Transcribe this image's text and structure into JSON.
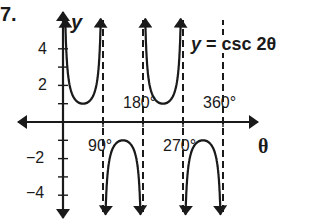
{
  "problem_number": "7.",
  "chart_data": {
    "type": "line",
    "title": "y = csc 2θ",
    "function": "csc(2*theta)",
    "xlabel": "θ",
    "ylabel": "y",
    "x_unit": "degrees",
    "xlim": [
      -60,
      420
    ],
    "ylim": [
      -5.5,
      5.5
    ],
    "x_tick_labels": [
      "90°",
      "180°",
      "270°",
      "360°"
    ],
    "x_ticks": [
      90,
      180,
      270,
      360
    ],
    "y_tick_labels": [
      "4",
      "2",
      "−2",
      "−4"
    ],
    "y_ticks": [
      -4,
      -3,
      -2,
      -1,
      1,
      2,
      3,
      4
    ],
    "labeled_y_ticks": [
      4,
      2,
      -2,
      -4
    ],
    "asymptotes": [
      0,
      90,
      180,
      270,
      360
    ],
    "branches": [
      {
        "from": 0,
        "to": 90,
        "direction": "up",
        "extremum": {
          "x": 45,
          "y": 1
        }
      },
      {
        "from": 90,
        "to": 180,
        "direction": "down",
        "extremum": {
          "x": 135,
          "y": -1
        }
      },
      {
        "from": 180,
        "to": 270,
        "direction": "up",
        "extremum": {
          "x": 225,
          "y": 1
        }
      },
      {
        "from": 270,
        "to": 360,
        "direction": "down",
        "extremum": {
          "x": 315,
          "y": -1
        }
      }
    ],
    "annotation": "y = csc 2θ",
    "grid": false,
    "legend": "none"
  },
  "labels": {
    "y_axis": "y",
    "x_axis": "θ",
    "equation_var": "y",
    "equation_rest": " = csc 2θ",
    "tick_4": "4",
    "tick_2": "2",
    "tick_m2": "−2",
    "tick_m4": "−4",
    "tick_90": "90°",
    "tick_180": "180°",
    "tick_270": "270°",
    "tick_360": "360°"
  },
  "colors": {
    "ink": "#1a1a1a",
    "background": "#ffffff"
  }
}
